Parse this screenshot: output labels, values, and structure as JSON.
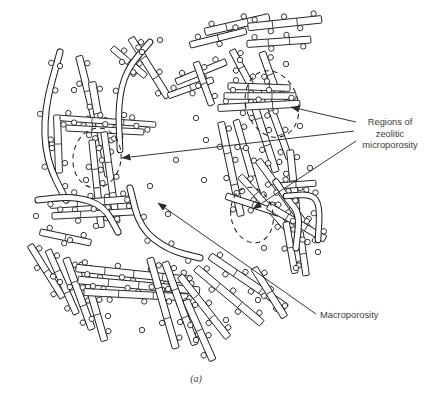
{
  "figure": {
    "caption": "(a)",
    "caption_pos": [
      196,
      382
    ],
    "background": "#ffffff",
    "ink_color": "#1a1a1a",
    "text_color": "#3a3a3a",
    "width": 431,
    "height": 409
  },
  "annotations": [
    {
      "id": "regions-zeolitic-microporosity",
      "lines": [
        "Regions of",
        "zeolitic",
        "microporosity"
      ],
      "anchor": [
        390,
        125
      ],
      "line_height": 11.5,
      "align": "middle",
      "leaders": [
        {
          "from": [
            356,
            122
          ],
          "to": [
            291,
            107
          ],
          "arrow": true
        },
        {
          "from": [
            354,
            131
          ],
          "to": [
            122,
            158
          ],
          "arrow": true
        },
        {
          "from": [
            356,
            141
          ],
          "to": [
            253,
            209
          ],
          "arrow": true
        }
      ]
    },
    {
      "id": "macroporosity",
      "lines": [
        "Macroporosity"
      ],
      "anchor": [
        320,
        318
      ],
      "line_height": 11.5,
      "align": "start",
      "leaders": [
        {
          "from": [
            316,
            314
          ],
          "to": [
            158,
            203
          ],
          "arrow": true
        }
      ]
    }
  ],
  "micropore_regions": [
    {
      "cx": 272,
      "cy": 104,
      "rx": 26,
      "ry": 34,
      "rot": -18
    },
    {
      "cx": 97,
      "cy": 158,
      "rx": 24,
      "ry": 30,
      "rot": 8
    },
    {
      "cx": 252,
      "cy": 215,
      "rx": 21,
      "ry": 28,
      "rot": -12
    }
  ],
  "laths": [
    {
      "x": 205,
      "y": 32,
      "len": 66,
      "w": 7.5,
      "ang": -13,
      "pores": 4,
      "ribs": 2
    },
    {
      "x": 248,
      "y": 27,
      "len": 74,
      "w": 7.5,
      "ang": -6,
      "pores": 5,
      "ribs": 2
    },
    {
      "x": 190,
      "y": 45,
      "len": 58,
      "w": 6.5,
      "ang": -14,
      "pores": 3,
      "ribs": 1
    },
    {
      "x": 247,
      "y": 44,
      "len": 64,
      "w": 7,
      "ang": -4,
      "pores": 4,
      "ribs": 2
    },
    {
      "x": 232,
      "y": 50,
      "len": 40,
      "w": 6.5,
      "ang": 62,
      "pores": 3,
      "ribs": 1
    },
    {
      "x": 262,
      "y": 52,
      "len": 48,
      "w": 7,
      "ang": 70,
      "pores": 3,
      "ribs": 1
    },
    {
      "x": 131,
      "y": 38,
      "len": 70,
      "w": 7,
      "ang": 58,
      "pores": 4,
      "ribs": 2
    },
    {
      "x": 79,
      "y": 56,
      "len": 72,
      "w": 7,
      "ang": 76,
      "pores": 4,
      "ribs": 1
    },
    {
      "x": 112,
      "y": 48,
      "len": 44,
      "w": 6,
      "ang": 40,
      "pores": 2,
      "ribs": 1
    },
    {
      "x": 92,
      "y": 82,
      "len": 96,
      "w": 7.5,
      "ang": 80,
      "pores": 6,
      "ribs": 2
    },
    {
      "x": 57,
      "y": 115,
      "len": 58,
      "w": 7,
      "ang": 88,
      "pores": 3,
      "ribs": 1
    },
    {
      "x": 60,
      "y": 118,
      "len": 96,
      "w": 5.5,
      "ang": 4,
      "pores": 6,
      "ribs": 2
    },
    {
      "x": 66,
      "y": 128,
      "len": 78,
      "w": 6,
      "ang": 3,
      "pores": 5,
      "ribs": 2
    },
    {
      "x": 92,
      "y": 140,
      "len": 88,
      "w": 6.5,
      "ang": 84,
      "pores": 5,
      "ribs": 2
    },
    {
      "x": 104,
      "y": 132,
      "len": 92,
      "w": 6.5,
      "ang": 82,
      "pores": 5,
      "ribs": 2
    },
    {
      "x": 50,
      "y": 205,
      "len": 82,
      "w": 7,
      "ang": -4,
      "pores": 5,
      "ribs": 2
    },
    {
      "x": 52,
      "y": 216,
      "len": 86,
      "w": 6.5,
      "ang": -3,
      "pores": 5,
      "ribs": 2
    },
    {
      "x": 40,
      "y": 232,
      "len": 52,
      "w": 6.5,
      "ang": 12,
      "pores": 3,
      "ribs": 1
    },
    {
      "x": 30,
      "y": 245,
      "len": 62,
      "w": 6.5,
      "ang": 58,
      "pores": 4,
      "ribs": 1
    },
    {
      "x": 48,
      "y": 250,
      "len": 70,
      "w": 6.5,
      "ang": 66,
      "pores": 4,
      "ribs": 2
    },
    {
      "x": 66,
      "y": 258,
      "len": 76,
      "w": 7,
      "ang": 70,
      "pores": 4,
      "ribs": 2
    },
    {
      "x": 82,
      "y": 262,
      "len": 82,
      "w": 7,
      "ang": 74,
      "pores": 5,
      "ribs": 2
    },
    {
      "x": 76,
      "y": 268,
      "len": 116,
      "w": 7.5,
      "ang": 6,
      "pores": 7,
      "ribs": 3
    },
    {
      "x": 78,
      "y": 280,
      "len": 122,
      "w": 7.5,
      "ang": 5,
      "pores": 7,
      "ribs": 3
    },
    {
      "x": 84,
      "y": 292,
      "len": 104,
      "w": 7,
      "ang": 3,
      "pores": 6,
      "ribs": 2
    },
    {
      "x": 150,
      "y": 258,
      "len": 94,
      "w": 7,
      "ang": 74,
      "pores": 5,
      "ribs": 2
    },
    {
      "x": 165,
      "y": 262,
      "len": 88,
      "w": 7,
      "ang": 70,
      "pores": 5,
      "ribs": 2
    },
    {
      "x": 180,
      "y": 276,
      "len": 78,
      "w": 7,
      "ang": 52,
      "pores": 5,
      "ribs": 2
    },
    {
      "x": 196,
      "y": 268,
      "len": 86,
      "w": 7.5,
      "ang": 40,
      "pores": 5,
      "ribs": 2
    },
    {
      "x": 210,
      "y": 256,
      "len": 92,
      "w": 7.5,
      "ang": 34,
      "pores": 6,
      "ribs": 2
    },
    {
      "x": 186,
      "y": 300,
      "len": 66,
      "w": 7,
      "ang": 66,
      "pores": 4,
      "ribs": 1
    },
    {
      "x": 254,
      "y": 268,
      "len": 58,
      "w": 7,
      "ang": 58,
      "pores": 3,
      "ribs": 1
    },
    {
      "x": 221,
      "y": 122,
      "len": 96,
      "w": 7,
      "ang": 78,
      "pores": 6,
      "ribs": 2
    },
    {
      "x": 236,
      "y": 120,
      "len": 88,
      "w": 6.5,
      "ang": 74,
      "pores": 5,
      "ribs": 2
    },
    {
      "x": 250,
      "y": 92,
      "len": 84,
      "w": 7,
      "ang": 72,
      "pores": 5,
      "ribs": 2
    },
    {
      "x": 263,
      "y": 86,
      "len": 78,
      "w": 6.5,
      "ang": 70,
      "pores": 4,
      "ribs": 2
    },
    {
      "x": 228,
      "y": 86,
      "len": 62,
      "w": 6.5,
      "ang": 2,
      "pores": 4,
      "ribs": 2
    },
    {
      "x": 224,
      "y": 96,
      "len": 72,
      "w": 6.5,
      "ang": 0,
      "pores": 4,
      "ribs": 2
    },
    {
      "x": 218,
      "y": 108,
      "len": 82,
      "w": 7,
      "ang": -3,
      "pores": 5,
      "ribs": 2
    },
    {
      "x": 176,
      "y": 82,
      "len": 54,
      "w": 6.5,
      "ang": -22,
      "pores": 3,
      "ribs": 1
    },
    {
      "x": 168,
      "y": 96,
      "len": 48,
      "w": 6,
      "ang": -20,
      "pores": 3,
      "ribs": 1
    },
    {
      "x": 196,
      "y": 62,
      "len": 46,
      "w": 6.5,
      "ang": 70,
      "pores": 3,
      "ribs": 1
    },
    {
      "x": 290,
      "y": 150,
      "len": 62,
      "w": 7,
      "ang": 84,
      "pores": 4,
      "ribs": 1
    },
    {
      "x": 258,
      "y": 160,
      "len": 86,
      "w": 7,
      "ang": 54,
      "pores": 5,
      "ribs": 2
    },
    {
      "x": 240,
      "y": 176,
      "len": 72,
      "w": 6.5,
      "ang": 48,
      "pores": 4,
      "ribs": 2
    },
    {
      "x": 226,
      "y": 196,
      "len": 56,
      "w": 6.5,
      "ang": 18,
      "pores": 3,
      "ribs": 1
    },
    {
      "x": 268,
      "y": 206,
      "len": 66,
      "w": 7,
      "ang": 30,
      "pores": 4,
      "ribs": 2
    },
    {
      "x": 286,
      "y": 222,
      "len": 52,
      "w": 6.5,
      "ang": 80,
      "pores": 3,
      "ribs": 1
    },
    {
      "x": 300,
      "y": 232,
      "len": 44,
      "w": 6.5,
      "ang": 82,
      "pores": 2,
      "ribs": 1
    },
    {
      "x": 276,
      "y": 186,
      "len": 40,
      "w": 6,
      "ang": -4,
      "pores": 2,
      "ribs": 1
    }
  ],
  "bent_rods": [
    {
      "pts": [
        [
          60,
          52
        ],
        [
          44,
          110
        ],
        [
          46,
          160
        ],
        [
          66,
          200
        ]
      ],
      "w": 5.5,
      "pores": 6
    },
    {
      "pts": [
        [
          150,
          42
        ],
        [
          126,
          70
        ],
        [
          118,
          104
        ],
        [
          120,
          150
        ]
      ],
      "w": 5.0,
      "pores": 5
    },
    {
      "pts": [
        [
          38,
          200
        ],
        [
          74,
          196
        ],
        [
          104,
          206
        ],
        [
          118,
          232
        ]
      ],
      "w": 5.5,
      "pores": 4
    },
    {
      "pts": [
        [
          130,
          188
        ],
        [
          140,
          228
        ],
        [
          168,
          250
        ],
        [
          200,
          258
        ]
      ],
      "w": 5.5,
      "pores": 5
    },
    {
      "pts": [
        [
          276,
          182
        ],
        [
          288,
          200
        ],
        [
          300,
          214
        ],
        [
          296,
          248
        ]
      ],
      "w": 5.5,
      "pores": 4
    },
    {
      "pts": [
        [
          286,
          196
        ],
        [
          312,
          194
        ],
        [
          320,
          206
        ],
        [
          318,
          240
        ]
      ],
      "w": 5.0,
      "pores": 4
    }
  ],
  "free_pores": [
    [
      60,
      66
    ],
    [
      74,
      90
    ],
    [
      122,
      62
    ],
    [
      142,
      52
    ],
    [
      160,
      40
    ],
    [
      196,
      118
    ],
    [
      206,
      140
    ],
    [
      240,
      60
    ],
    [
      286,
      64
    ],
    [
      300,
      126
    ],
    [
      310,
      168
    ],
    [
      176,
      160
    ],
    [
      150,
      186
    ],
    [
      96,
      226
    ],
    [
      60,
      282
    ],
    [
      108,
      316
    ],
    [
      142,
      330
    ],
    [
      196,
      340
    ],
    [
      226,
      320
    ],
    [
      258,
      300
    ],
    [
      296,
      268
    ],
    [
      318,
      252
    ],
    [
      86,
      180
    ],
    [
      52,
      148
    ],
    [
      70,
      240
    ],
    [
      36,
      216
    ],
    [
      204,
      180
    ],
    [
      168,
      214
    ],
    [
      246,
      148
    ],
    [
      264,
      248
    ]
  ]
}
